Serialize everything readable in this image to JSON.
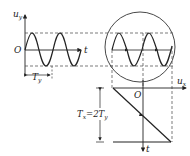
{
  "diagram": {
    "labels": {
      "uy_axis": "u",
      "uy_sub": "y",
      "origin_left": "O",
      "t_left": "t",
      "ty": "T",
      "ty_sub": "y",
      "ux_axis": "u",
      "ux_sub": "x",
      "origin_right": "O",
      "t_bottom": "t",
      "tx_eq_main": "T",
      "tx_eq_sub1": "x",
      "tx_eq_mid": "=2T",
      "tx_eq_sub2": "y"
    },
    "relation": "Tx = 2Ty",
    "colors": {
      "stroke": "#222222",
      "dashed": "#444444",
      "background": "#ffffff"
    }
  }
}
